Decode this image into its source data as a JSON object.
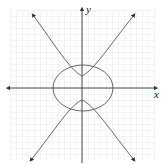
{
  "diagram": {
    "title": "",
    "axes": {
      "x_label": "x",
      "y_label": "y"
    },
    "curves": [
      {
        "name": "ellipse",
        "type": "ellipse",
        "description": "ellipse centered at origin, wider than tall"
      },
      {
        "name": "hyperbola",
        "type": "hyperbola",
        "description": "hyperbola opening up and down with arrowheads at ends"
      }
    ],
    "colors": {
      "grid": "#d9d9d9",
      "axis": "#333333",
      "curve": "#555555"
    }
  }
}
